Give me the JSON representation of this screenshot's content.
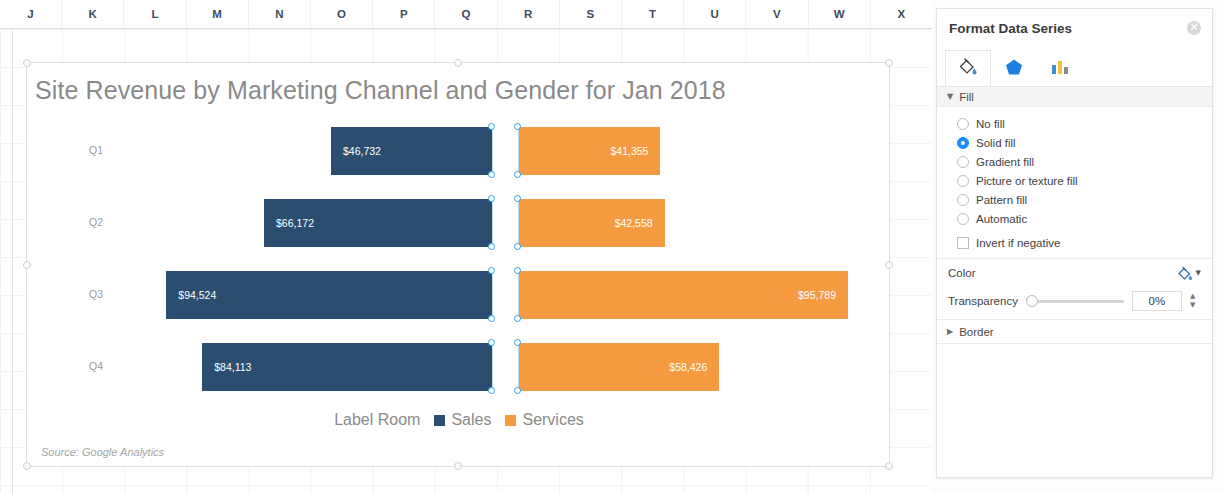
{
  "spreadsheet": {
    "columns": [
      "J",
      "K",
      "L",
      "M",
      "N",
      "O",
      "P",
      "Q",
      "R",
      "S",
      "T",
      "U",
      "V",
      "W",
      "X"
    ]
  },
  "chart_data": {
    "type": "bar",
    "subtype": "diverging-horizontal-bar",
    "title": "Site Revenue by Marketing Channel and Gender for Jan 2018",
    "categories": [
      "Q1",
      "Q2",
      "Q3",
      "Q4"
    ],
    "series": [
      {
        "name": "Sales",
        "color": "#2a4d70",
        "side": "left",
        "values": [
          46732,
          66172,
          94524,
          84113
        ],
        "labels": [
          "$46,732",
          "$66,172",
          "$94,524",
          "$84,113"
        ]
      },
      {
        "name": "Services",
        "color": "#f49a40",
        "side": "right",
        "values": [
          41355,
          42558,
          95789,
          58426
        ],
        "labels": [
          "$41,355",
          "$42,558",
          "$95,789",
          "$58,426"
        ]
      }
    ],
    "axis_label": "Label Room",
    "source_note": "Source: Google Analytics",
    "legend_position": "bottom",
    "grid": false,
    "max_value": 95789,
    "selected_series": "Sales"
  },
  "panel": {
    "title": "Format Data Series",
    "close_label": "✕",
    "tabs": [
      {
        "name": "fill-and-line",
        "icon": "paint-bucket-icon",
        "active": true
      },
      {
        "name": "effects",
        "icon": "pentagon-icon",
        "active": false
      },
      {
        "name": "series-options",
        "icon": "bar-chart-icon",
        "active": false
      }
    ],
    "fill_section": {
      "label": "Fill",
      "expanded": true,
      "caret": "▼",
      "options": [
        {
          "label": "No fill",
          "selected": false
        },
        {
          "label": "Solid fill",
          "selected": true
        },
        {
          "label": "Gradient fill",
          "selected": false
        },
        {
          "label": "Picture or texture fill",
          "selected": false
        },
        {
          "label": "Pattern fill",
          "selected": false
        },
        {
          "label": "Automatic",
          "selected": false
        }
      ],
      "invert_label": "Invert if negative",
      "invert_checked": false,
      "color_label": "Color",
      "transparency_label": "Transparency",
      "transparency_value": "0%"
    },
    "border_section": {
      "label": "Border",
      "expanded": false,
      "caret": "▶"
    },
    "accent_color": "#1a8cff"
  }
}
